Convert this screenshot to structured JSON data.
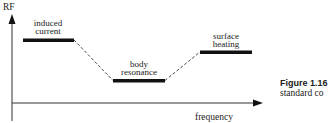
{
  "diagram": {
    "y_axis_label": "RF",
    "x_axis_label": "frequency",
    "regions": [
      {
        "label_line1": "induced",
        "label_line2": "current"
      },
      {
        "label_line1": "body",
        "label_line2": "resonance"
      },
      {
        "label_line1": "surface",
        "label_line2": "heating"
      }
    ]
  },
  "caption": {
    "figure": "Figure 1.16",
    "text": "standard co"
  },
  "colors": {
    "ink": "#111111",
    "axis": "#333333"
  }
}
